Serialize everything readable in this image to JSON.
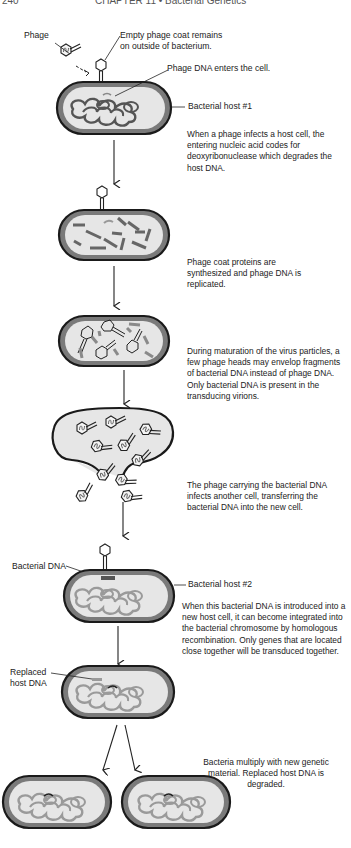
{
  "page_header": {
    "page_number": "240",
    "chapter": "CHAPTER 11 • Bacterial Genetics"
  },
  "labels": {
    "phage": "Phage",
    "empty_coat": [
      "Empty phage coat remains",
      "on outside of bacterium."
    ],
    "phage_dna_enters": "Phage DNA enters the cell.",
    "host1": "Bacterial host #1",
    "bacterial_dna": "Bacterial DNA",
    "host2": "Bacterial host #2",
    "replaced_host_dna": [
      "Replaced",
      "host DNA"
    ]
  },
  "steps": [
    {
      "id": "step1",
      "text": "When a phage infects a host cell, the entering nucleic acid codes for deoxyribonuclease which degrades the host DNA."
    },
    {
      "id": "step2",
      "text": "Phage coat proteins are synthesized and phage DNA is replicated."
    },
    {
      "id": "step3",
      "text": "During maturation of the virus particles, a few phage heads may envelop fragments of bacterial DNA instead of phage DNA. Only bacterial DNA is present in the transducing virions."
    },
    {
      "id": "step4",
      "text": "The phage carrying the bacterial DNA infects another cell, transferring the bacterial DNA into the new cell."
    },
    {
      "id": "step5",
      "text": "When this bacterial DNA is introduced into a new host cell, it can become integrated into the bacterial chromosome by homologous recombination. Only genes that are located close together will be transduced together."
    },
    {
      "id": "step6",
      "text": "Bacteria multiply with new genetic material. Replaced host DNA is degraded."
    }
  ],
  "colors": {
    "cell_outline": "#1a1a1a",
    "cell_wall": "#7a7a7a",
    "cytoplasm": "#e6e6e6",
    "host_dna": "#555555",
    "new_host_dna": "#9a9a9a",
    "phage_dna_fragment": "#888888"
  }
}
